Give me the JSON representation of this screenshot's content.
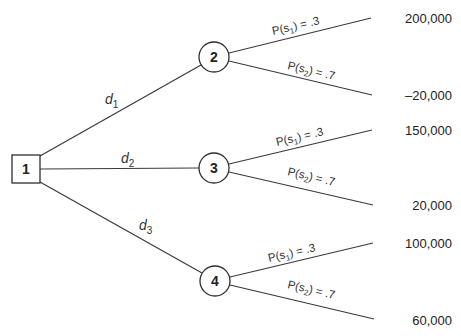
{
  "diagram": {
    "type": "decision-tree",
    "decision_node": {
      "id": "1",
      "shape": "square",
      "x": 26,
      "y": 169
    },
    "chance_nodes": [
      {
        "id": "2",
        "shape": "circle",
        "x": 214,
        "y": 57
      },
      {
        "id": "3",
        "shape": "circle",
        "x": 214,
        "y": 168
      },
      {
        "id": "4",
        "shape": "circle",
        "x": 215,
        "y": 281
      }
    ],
    "decisions": [
      {
        "label": "d",
        "sub": "1",
        "to": "2"
      },
      {
        "label": "d",
        "sub": "2",
        "to": "3"
      },
      {
        "label": "d",
        "sub": "3",
        "to": "4"
      }
    ],
    "branches": [
      {
        "from": "2",
        "prob_text": "P(s₁) = .3",
        "prob_pre": "P(s",
        "prob_sub": "1",
        "prob_post": ") = .3",
        "payoff": "200,000"
      },
      {
        "from": "2",
        "prob_text": "P(s₂) = .7",
        "prob_pre": "P(s",
        "prob_sub": "2",
        "prob_post": ") = .7",
        "payoff": "–20,000"
      },
      {
        "from": "3",
        "prob_text": "P(s₁) = .3",
        "prob_pre": "P(s",
        "prob_sub": "1",
        "prob_post": ") = .3",
        "payoff": "150,000"
      },
      {
        "from": "3",
        "prob_text": "P(s₂) = .7",
        "prob_pre": "P(s",
        "prob_sub": "2",
        "prob_post": ") = .7",
        "payoff": "20,000"
      },
      {
        "from": "4",
        "prob_text": "P(s₁) = .3",
        "prob_pre": "P(s",
        "prob_sub": "1",
        "prob_post": ") = .3",
        "payoff": "100,000"
      },
      {
        "from": "4",
        "prob_text": "P(s₂) = .7",
        "prob_pre": "P(s",
        "prob_sub": "2",
        "prob_post": ") = .7",
        "payoff": "60,000"
      }
    ]
  }
}
